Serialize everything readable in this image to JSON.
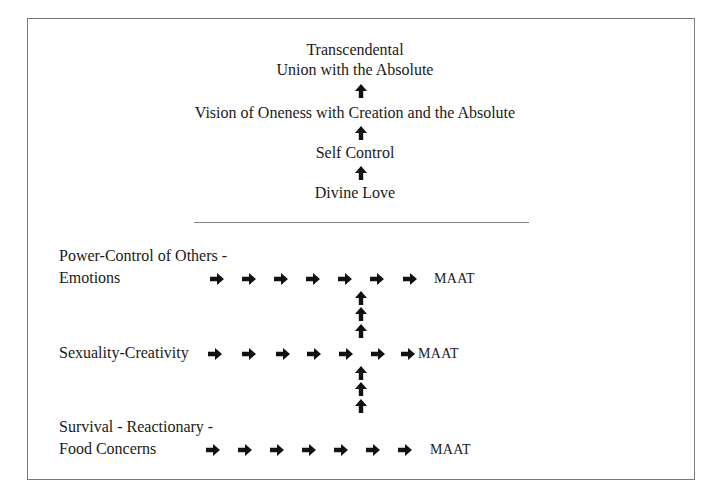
{
  "diagram": {
    "frame": {
      "border_color": "#7a7a7a"
    },
    "upper_stack": [
      {
        "id": "transcendental",
        "text": "Transcendental"
      },
      {
        "id": "union",
        "text": "Union with the Absolute"
      },
      {
        "id": "vision",
        "text": "Vision of Oneness with Creation and the Absolute"
      },
      {
        "id": "self-control",
        "text": "Self Control"
      },
      {
        "id": "divine-love",
        "text": "Divine Love"
      }
    ],
    "upper_arrows": [
      {
        "icon": "up-arrow-icon",
        "between": [
          "union",
          "vision"
        ]
      },
      {
        "icon": "up-arrow-icon",
        "between": [
          "vision",
          "self-control"
        ]
      },
      {
        "icon": "up-arrow-icon",
        "between": [
          "self-control",
          "divine-love"
        ]
      }
    ],
    "divider": {
      "color": "#808080"
    },
    "levels": [
      {
        "label_line1": "Power-Control of Others -",
        "label_line2": "Emotions",
        "right_arrow_count": 7,
        "target": "MAAT"
      },
      {
        "label_line1": "Sexuality-Creativity",
        "right_arrow_count": 7,
        "target": "MAAT"
      },
      {
        "label_line1": "Survival - Reactionary -",
        "label_line2": "Food Concerns",
        "right_arrow_count": 7,
        "target": "MAAT"
      }
    ],
    "connectors": [
      {
        "icon": "up-arrow-icon",
        "count": 3,
        "from_level": 2,
        "to_level": 1
      },
      {
        "icon": "up-arrow-icon",
        "count": 3,
        "from_level": 3,
        "to_level": 2
      }
    ],
    "arrow_color": "#111111"
  }
}
